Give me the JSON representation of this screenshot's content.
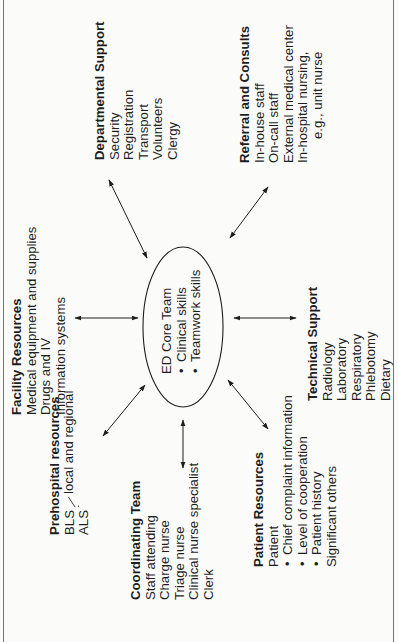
{
  "diagram": {
    "center": {
      "title": "ED Core Team",
      "bullets": [
        "Clinical skills",
        "Teamwork skills"
      ]
    },
    "nodes": {
      "departmental_support": {
        "title": "Departmental Support",
        "items": [
          "Security",
          "Registration",
          "Transport",
          "Volunteers",
          "Clergy"
        ]
      },
      "referral_consults": {
        "title": "Referral and Consults",
        "items": [
          "In-house staff",
          "On-call staff",
          "External medical center",
          "In-hospital nursing,"
        ],
        "continuation": "e.g., unit nurse"
      },
      "facility_resources": {
        "title": "Facility Resources",
        "items": [
          "Medical equipment and supplies",
          "Drugs and IV",
          "Information systems"
        ]
      },
      "technical_support": {
        "title": "Technical Support",
        "items": [
          "Radiology",
          "Laboratory",
          "Respiratory",
          "Phlebotomy",
          "Dietary"
        ]
      },
      "prehospital_resources": {
        "title": "Prehospital resources",
        "items": [
          "BLS",
          "ALS"
        ],
        "qualifier": "local and regional"
      },
      "coordinating_team": {
        "title": "Coordinating Team",
        "items": [
          "Staff attending",
          "Charge nurse",
          "Triage nurse",
          "Clinical nurse specialist",
          "Clerk"
        ]
      },
      "patient_resources": {
        "title": "Patient Resources",
        "items": [
          "Patient"
        ],
        "bullets": [
          "Chief complaint information",
          "Level of cooperation",
          "Patient history"
        ],
        "after": [
          "Significant others"
        ]
      }
    },
    "connections": [
      {
        "from": "ED Core Team",
        "to": "Departmental Support",
        "type": "bidirectional-arrow"
      },
      {
        "from": "ED Core Team",
        "to": "Referral and Consults",
        "type": "bidirectional-arrow"
      },
      {
        "from": "ED Core Team",
        "to": "Facility Resources",
        "type": "bidirectional-arrow"
      },
      {
        "from": "ED Core Team",
        "to": "Technical Support",
        "type": "bidirectional-arrow"
      },
      {
        "from": "ED Core Team",
        "to": "Prehospital resources",
        "type": "bidirectional-arrow"
      },
      {
        "from": "ED Core Team",
        "to": "Coordinating Team",
        "type": "bidirectional-arrow"
      },
      {
        "from": "ED Core Team",
        "to": "Patient Resources",
        "type": "bidirectional-arrow"
      }
    ],
    "orientation": "rotated-90-ccw",
    "colors": {
      "ink": "#1e1e1e",
      "paper": "#fbfbfa",
      "frame": "#777777"
    }
  }
}
